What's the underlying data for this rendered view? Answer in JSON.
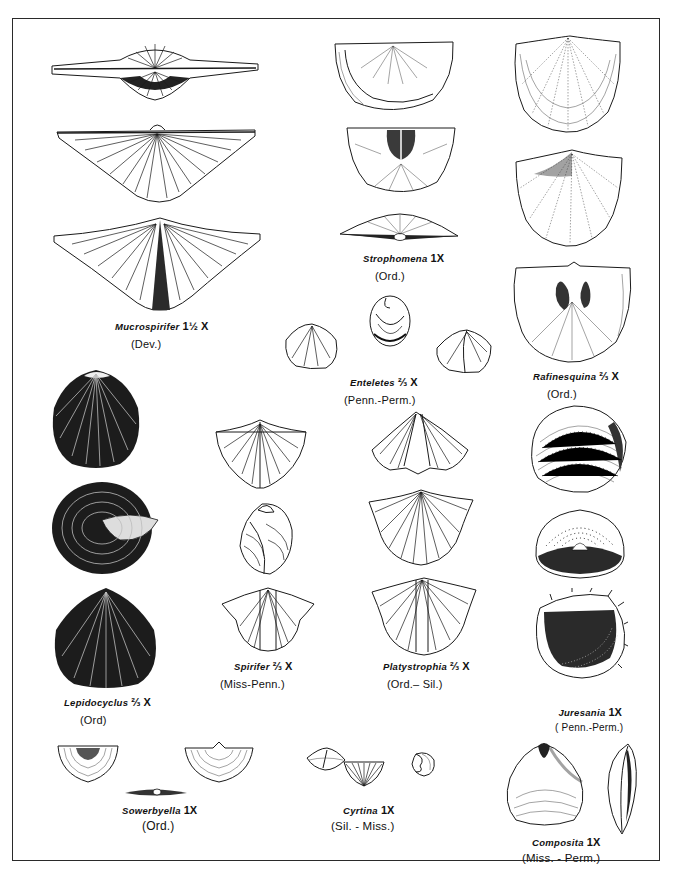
{
  "plate": {
    "frame": {
      "left": 12,
      "top": 18,
      "right": 661,
      "bottom": 862,
      "border_color": "#2a2a2a"
    },
    "background": "#ffffff",
    "ink_color": "#1a1a1a"
  },
  "specimens": [
    {
      "id": "mucrospirifer",
      "name": "Mucrospirifer",
      "scale": "1½ X",
      "age": "(Dev.)",
      "views": 3
    },
    {
      "id": "strophomena",
      "name": "Strophomena",
      "scale": "1X",
      "age": "(Ord.)",
      "views": 3
    },
    {
      "id": "rafinesquina",
      "name": "Rafinesquina",
      "scale": "⅔ X",
      "age": "(Ord.)",
      "views": 3
    },
    {
      "id": "enteletes",
      "name": "Enteletes",
      "scale": "⅔ X",
      "age": "(Penn.-Perm.)",
      "views": 3
    },
    {
      "id": "lepidocyclus",
      "name": "Lepidocyclus",
      "scale": "⅔ X",
      "age": "(Ord)",
      "views": 3
    },
    {
      "id": "spirifer",
      "name": "Spirifer",
      "scale": "⅔ X",
      "age": "(Miss-Penn.)",
      "views": 3
    },
    {
      "id": "platystrophia",
      "name": "Platystrophia",
      "scale": "⅔ X",
      "age": "(Ord.– Sil.)",
      "views": 3
    },
    {
      "id": "juresania",
      "name": "Juresania",
      "scale": "1X",
      "age": "( Penn.-Perm.)",
      "views": 3
    },
    {
      "id": "sowerbyella",
      "name": "Sowerbyella",
      "scale": "1X",
      "age": "(Ord.)",
      "views": 3
    },
    {
      "id": "cyrtina",
      "name": "Cyrtina",
      "scale": "1X",
      "age": "(Sil. - Miss.)",
      "views": 3
    },
    {
      "id": "composita",
      "name": "Composita",
      "scale": "1X",
      "age": "(Miss. - Perm.)",
      "views": 2
    }
  ]
}
